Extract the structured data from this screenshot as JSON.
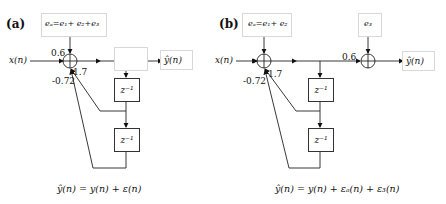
{
  "panels": [
    {
      "id": "a",
      "label": "(a)",
      "input": "x(n)",
      "output": "ŷ(n)",
      "error_box": "eₐ=e₁+ e₂+e₃",
      "gain_input": "0.6",
      "gain_fb1": "1.7",
      "gain_fb2": "-0.72",
      "delay1": "z⁻¹",
      "delay2": "z⁻¹",
      "equation": "ŷ(n) = y(n) + ε(n)"
    },
    {
      "id": "b",
      "label": "(b)",
      "input": "x(n)",
      "output": "ŷ(n)",
      "error_box": "eₐ=e₁+ e₂",
      "error_box2": "e₃",
      "gain_output": "0.6",
      "gain_fb1": "1.7",
      "gain_fb2": "-0.72",
      "delay1": "z⁻¹",
      "delay2": "z⁻¹",
      "equation": "ŷ(n) = y(n) + εₐ(n) + ε₃(n)"
    }
  ]
}
